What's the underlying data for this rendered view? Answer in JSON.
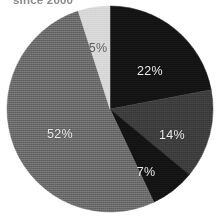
{
  "title": "since 2000",
  "colors": {
    "background": "#ffffff",
    "title_text": "#8a8a8a",
    "label_on_dark": "#e9e9e9",
    "label_on_light": "#5f5f5f"
  },
  "chart_data": {
    "type": "pie",
    "title": "since 2000",
    "xlabel": "",
    "ylabel": "",
    "grid": false,
    "legend": "none",
    "start_angle_deg": 0,
    "direction": "clockwise",
    "center": {
      "x": 110,
      "y": 109
    },
    "radius": 103,
    "categories": [
      "22%",
      "14%",
      "7%",
      "52%",
      "5%"
    ],
    "values": [
      22,
      14,
      7,
      52,
      5
    ],
    "labels": [
      "22%",
      "14%",
      "7%",
      "52%",
      "5%"
    ],
    "slices": [
      {
        "label": "22%",
        "value": 22,
        "color": "#141414",
        "label_color": "#e9e9e9",
        "label_tone": "on-dark",
        "label_x": 150,
        "label_y": 71
      },
      {
        "label": "14%",
        "value": 14,
        "color": "#3e3e3e",
        "label_color": "#e9e9e9",
        "label_tone": "on-dark",
        "label_x": 172,
        "label_y": 135
      },
      {
        "label": "7%",
        "value": 7,
        "color": "#141414",
        "label_color": "#e9e9e9",
        "label_tone": "on-dark",
        "label_x": 146,
        "label_y": 172
      },
      {
        "label": "52%",
        "value": 52,
        "color": "#6e6e6e",
        "label_color": "#e9e9e9",
        "label_tone": "on-dark",
        "label_x": 60,
        "label_y": 134
      },
      {
        "label": "5%",
        "value": 5,
        "color": "#d8d8d8",
        "label_color": "#5f5f5f",
        "label_tone": "on-light",
        "label_x": 98,
        "label_y": 48
      }
    ],
    "total": 100
  }
}
